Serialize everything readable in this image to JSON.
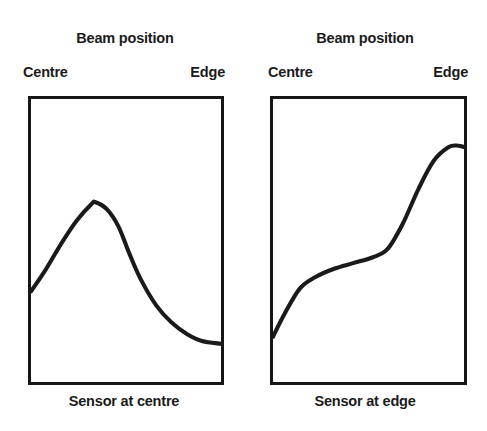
{
  "figure": {
    "background_color": "#ffffff",
    "ink_color": "#1a1a1a",
    "frame_color": "#161616"
  },
  "panels": [
    {
      "title": "Beam position",
      "axis_start_label": "Centre",
      "axis_end_label": "Edge",
      "caption": "Sensor at centre"
    },
    {
      "title": "Beam position",
      "axis_start_label": "Centre",
      "axis_end_label": "Edge",
      "caption": "Sensor at edge"
    }
  ],
  "chart_data": [
    {
      "type": "line",
      "title": "Beam position",
      "xlabel": "Sensor at centre",
      "ylabel": "",
      "xlim": [
        0,
        1
      ],
      "ylim": [
        0,
        1
      ],
      "grid": false,
      "legend": null,
      "xtick_labels": [
        "Centre",
        "Edge"
      ],
      "xtick_values": [
        0,
        1
      ],
      "annotations": [
        "Beam position",
        "Centre",
        "Edge",
        "Sensor at centre"
      ],
      "series": [
        {
          "name": "Sensor at centre response",
          "x": [
            0.0,
            0.08,
            0.16,
            0.24,
            0.32,
            0.34,
            0.4,
            0.46,
            0.52,
            0.58,
            0.66,
            0.74,
            0.82,
            0.9,
            1.0
          ],
          "values": [
            0.32,
            0.4,
            0.49,
            0.57,
            0.63,
            0.635,
            0.61,
            0.55,
            0.45,
            0.36,
            0.27,
            0.21,
            0.17,
            0.145,
            0.135
          ]
        }
      ]
    },
    {
      "type": "line",
      "title": "Beam position",
      "xlabel": "Sensor at edge",
      "ylabel": "",
      "xlim": [
        0,
        1
      ],
      "ylim": [
        0,
        1
      ],
      "grid": false,
      "legend": null,
      "xtick_labels": [
        "Centre",
        "Edge"
      ],
      "xtick_values": [
        0,
        1
      ],
      "annotations": [
        "Beam position",
        "Centre",
        "Edge",
        "Sensor at edge"
      ],
      "series": [
        {
          "name": "Sensor at edge response",
          "x": [
            0.0,
            0.06,
            0.14,
            0.22,
            0.32,
            0.42,
            0.52,
            0.6,
            0.68,
            0.76,
            0.84,
            0.92,
            0.97,
            1.0
          ],
          "values": [
            0.16,
            0.24,
            0.33,
            0.37,
            0.4,
            0.42,
            0.44,
            0.47,
            0.56,
            0.68,
            0.78,
            0.83,
            0.835,
            0.83
          ]
        }
      ]
    }
  ]
}
